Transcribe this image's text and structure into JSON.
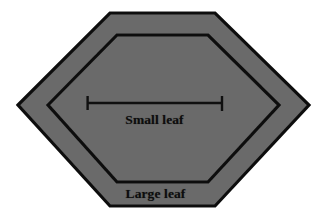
{
  "figure": {
    "background_color": "#ffffff",
    "fill_color": "#6b6b6b",
    "outline_color": "#111111",
    "label_color": "#0d0d0d",
    "labels": {
      "small_leaf": "Small leaf",
      "large_leaf": "Large leaf"
    },
    "shapes": [
      {
        "name": "large-leaf-hexagon",
        "label": "Large leaf",
        "points": "18,105 110,13 215,13 309,105 215,206 110,206",
        "fill": "#6b6b6b",
        "stroke": "#111111",
        "stroke_width": 3.2
      },
      {
        "name": "small-leaf-hexagon",
        "label": "Small leaf",
        "points": "48,105 117,35 208,35 279,105 208,182 117,182",
        "fill": "#6b6b6b",
        "stroke": "#111111",
        "stroke_width": 3.2
      }
    ],
    "measurement": {
      "name": "small-leaf-width-measure",
      "orientation": "horizontal",
      "y": 103,
      "x_start": 87,
      "x_end": 222,
      "cap_half_height": 7,
      "stroke": "#101010",
      "stroke_width": 2.4
    }
  }
}
